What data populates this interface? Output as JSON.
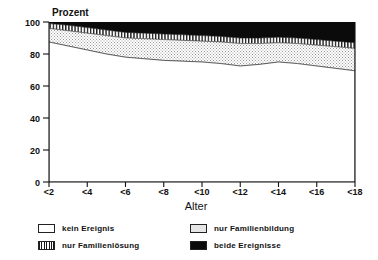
{
  "chart_data": {
    "type": "area",
    "title": "",
    "ylabel": "Prozent",
    "xlabel": "Alter",
    "ylim": [
      0,
      100
    ],
    "yticks": [
      0,
      20,
      40,
      60,
      80,
      100
    ],
    "xticks": [
      "<2",
      "<4",
      "<6",
      "<8",
      "<10",
      "<12",
      "<14",
      "<16",
      "<18"
    ],
    "x": [
      2,
      3,
      4,
      5,
      6,
      7,
      8,
      9,
      10,
      11,
      12,
      13,
      14,
      15,
      16,
      17,
      18
    ],
    "stacked": true,
    "grid": false,
    "legend_position": "bottom",
    "series": [
      {
        "name": "kein Ereignis",
        "pattern": "white",
        "values": [
          87.5,
          85.0,
          82.5,
          80.0,
          78.0,
          77.0,
          76.0,
          75.5,
          75.0,
          74.0,
          72.5,
          73.5,
          75.0,
          74.0,
          72.5,
          71.0,
          69.5
        ]
      },
      {
        "name": "nur Familienbildung",
        "pattern": "dotted-gray",
        "values": [
          8.5,
          9.5,
          10.5,
          11.5,
          12.0,
          12.5,
          13.0,
          13.0,
          13.0,
          13.5,
          14.0,
          13.0,
          12.0,
          12.5,
          13.0,
          13.5,
          14.0
        ]
      },
      {
        "name": "nur Familienlösung",
        "pattern": "vertical-hatch",
        "values": [
          3.0,
          3.5,
          3.5,
          3.5,
          3.5,
          3.5,
          3.5,
          3.5,
          3.5,
          3.5,
          3.5,
          3.5,
          3.5,
          3.5,
          3.5,
          3.5,
          3.5
        ]
      },
      {
        "name": "beide Ereignisse",
        "pattern": "solid-black",
        "values": [
          1.0,
          2.0,
          3.5,
          5.0,
          6.5,
          7.0,
          7.5,
          8.0,
          8.5,
          9.0,
          10.0,
          10.0,
          9.5,
          10.0,
          11.0,
          12.0,
          13.0
        ]
      }
    ],
    "colors": {
      "kein_ereignis": "#ffffff",
      "nur_familienbildung": "#e6e6e6",
      "nur_familienloesung": "#ffffff",
      "beide_ereignisse": "#0b0b0b",
      "axis": "#111111"
    }
  },
  "axes": {
    "y_title": "Prozent",
    "x_title": "Alter",
    "y_tick_0": "0",
    "y_tick_20": "20",
    "y_tick_40": "40",
    "y_tick_60": "60",
    "y_tick_80": "80",
    "y_tick_100": "100",
    "x_tick_1": "<2",
    "x_tick_2": "<4",
    "x_tick_3": "<6",
    "x_tick_4": "<8",
    "x_tick_5": "<10",
    "x_tick_6": "<12",
    "x_tick_7": "<14",
    "x_tick_8": "<16",
    "x_tick_9": "<18"
  },
  "legend": {
    "items": [
      {
        "label": "kein Ereignis",
        "pattern": "white"
      },
      {
        "label": "nur Familienbildung",
        "pattern": "dotted-gray"
      },
      {
        "label": "nur Familienlösung",
        "pattern": "vertical-hatch"
      },
      {
        "label": "beide Ereignisse",
        "pattern": "solid-black"
      }
    ]
  }
}
